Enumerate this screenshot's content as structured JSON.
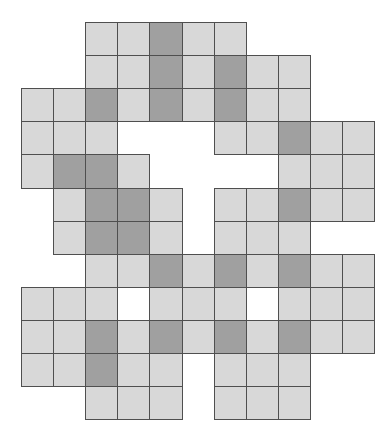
{
  "figure": {
    "type": "polyomino-grid",
    "origin_px": [
      21,
      22
    ],
    "cell_px": [
      32.1,
      33.1
    ],
    "colors": {
      "light": "#d8d8d8",
      "dark": "#a0a0a0",
      "empty": "#ffffff",
      "border": "#4f4f4f"
    },
    "legend": "L = light gray cell, D = dark gray cell, W = white (empty) bordered cell, . = no cell",
    "rows": [
      "..LLDLL....",
      "..LLDLDLL..",
      "LLDLDLDLL..",
      "LLL...LLDLL",
      "LDDL....LLL",
      ".LDDL.LLDLL",
      ".LDDL.LLL..",
      "..LLDLDLDLL",
      "LLLWLLLWLLL",
      "LLDLDLDLDLL",
      "LLDLL.LLL..",
      "..LLL.LLL.."
    ]
  }
}
